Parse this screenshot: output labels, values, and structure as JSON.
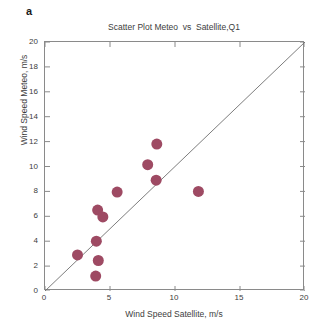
{
  "panel": {
    "letter": "a"
  },
  "chart_data": {
    "type": "scatter",
    "title": "Scatter Plot Meteo  vs  Satellite,Q1",
    "xlabel": "Wind Speed Satellite, m/s",
    "ylabel": "Wind Speed Meteo, m/s",
    "xlim": [
      0,
      20
    ],
    "ylim": [
      0,
      20
    ],
    "xticks": [
      0,
      5,
      10,
      15,
      20
    ],
    "yticks": [
      0,
      2,
      4,
      6,
      8,
      10,
      12,
      14,
      16,
      18,
      20
    ],
    "grid": false,
    "legend": null,
    "marker_color": "#9e4a63",
    "marker_size": 5.5,
    "reference_line": {
      "name": "one-to-one-line",
      "from": [
        0,
        0
      ],
      "to": [
        20,
        20
      ],
      "color": "#6e6e6e"
    },
    "points": [
      {
        "x": 2.5,
        "y": 2.9
      },
      {
        "x": 3.9,
        "y": 1.2
      },
      {
        "x": 4.1,
        "y": 2.45
      },
      {
        "x": 3.95,
        "y": 4.0
      },
      {
        "x": 4.05,
        "y": 6.5
      },
      {
        "x": 4.45,
        "y": 5.95
      },
      {
        "x": 5.55,
        "y": 7.95
      },
      {
        "x": 7.9,
        "y": 10.15
      },
      {
        "x": 8.55,
        "y": 8.9
      },
      {
        "x": 8.6,
        "y": 11.8
      },
      {
        "x": 11.8,
        "y": 8.0
      }
    ]
  }
}
